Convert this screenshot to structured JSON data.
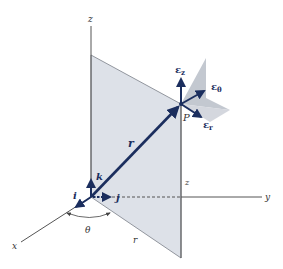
{
  "diagram": {
    "axes": {
      "x_label": "x",
      "y_label": "y",
      "z_label": "z"
    },
    "vectors": {
      "position_label": "r",
      "point_label": "P",
      "i_label": "i",
      "j_label": "j",
      "k_label": "k",
      "eps_symbol": "ε",
      "e_z_sub": "z",
      "e_theta_sub": "θ",
      "e_r_sub": "r"
    },
    "annotations": {
      "angle_label": "θ",
      "radial_label": "r",
      "height_label": "z"
    },
    "colors": {
      "vector": "#1b2e5e",
      "plane": "#d9dde4",
      "plane_dark": "#a9adb6",
      "axis": "#555555"
    }
  }
}
